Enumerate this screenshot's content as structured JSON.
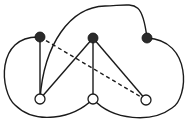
{
  "diagram": {
    "type": "graph",
    "colors": {
      "edge": "#1a1a1a",
      "filled_node": "#2b2b2b",
      "open_node_fill": "#ffffff",
      "open_node_stroke": "#1a1a1a",
      "background": "#ffffff"
    },
    "nodes": [
      {
        "id": "a1",
        "kind": "filled",
        "x": 40,
        "y": 37
      },
      {
        "id": "a2",
        "kind": "filled",
        "x": 93,
        "y": 38
      },
      {
        "id": "a3",
        "kind": "filled",
        "x": 147,
        "y": 38
      },
      {
        "id": "b1",
        "kind": "open",
        "x": 40,
        "y": 99
      },
      {
        "id": "b2",
        "kind": "open",
        "x": 93,
        "y": 99
      },
      {
        "id": "b3",
        "kind": "open",
        "x": 146,
        "y": 100
      }
    ],
    "edges": [
      {
        "from": "a1",
        "to": "b1",
        "style": "solid",
        "shape": "straight"
      },
      {
        "from": "a2",
        "to": "b1",
        "style": "solid",
        "shape": "straight"
      },
      {
        "from": "a2",
        "to": "b2",
        "style": "solid",
        "shape": "straight"
      },
      {
        "from": "a2",
        "to": "b3",
        "style": "solid",
        "shape": "straight"
      },
      {
        "from": "a1",
        "to": "b3",
        "style": "dashed",
        "shape": "straight"
      },
      {
        "from": "b1",
        "to": "a3",
        "style": "solid",
        "shape": "curve-top"
      },
      {
        "from": "a1",
        "to": "b2",
        "style": "solid",
        "shape": "curve-left"
      },
      {
        "from": "a3",
        "to": "b2",
        "style": "solid",
        "shape": "curve-right"
      }
    ]
  }
}
